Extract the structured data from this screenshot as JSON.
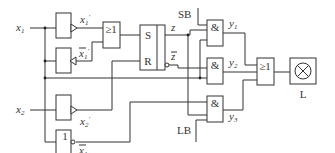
{
  "diagram": {
    "type": "logic-circuit",
    "inputs": [
      {
        "name": "x1",
        "label": "x",
        "sub": "1"
      },
      {
        "name": "x2",
        "label": "x",
        "sub": "2"
      }
    ],
    "signals": {
      "x1_prime": {
        "label": "x",
        "sub": "1",
        "mark": "'"
      },
      "x1_prime_bar": {
        "label": "x",
        "sub": "1",
        "mark": "'",
        "overline": true
      },
      "x2_prime": {
        "label": "x",
        "sub": "2",
        "mark": "'"
      },
      "x1_bar": {
        "label": "x",
        "sub": "1",
        "overline": true
      },
      "z": {
        "label": "z"
      },
      "z_bar": {
        "label": "z",
        "overline": true
      },
      "y1": {
        "label": "y",
        "sub": "1"
      },
      "y2": {
        "label": "y",
        "sub": "2"
      },
      "y3": {
        "label": "y",
        "sub": "3"
      }
    },
    "gates": {
      "or1": "≥1",
      "not1": "1",
      "and1": "&",
      "and2": "&",
      "and3": "&",
      "or2": "≥1"
    },
    "flipflop": {
      "s": "S",
      "r": "R"
    },
    "external": {
      "sb": "SB",
      "lb": "LB"
    },
    "output": {
      "lamp_label": "L"
    }
  }
}
